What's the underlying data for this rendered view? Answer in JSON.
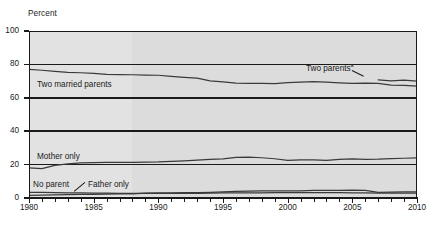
{
  "chart_data": {
    "type": "line",
    "title": "",
    "xlabel": "",
    "ylabel": "Percent",
    "xlim": [
      1980,
      2010
    ],
    "ylim": [
      0,
      100
    ],
    "yticks": [
      0,
      20,
      40,
      60,
      80,
      100
    ],
    "xticks": [
      1980,
      1985,
      1990,
      1995,
      2000,
      2005,
      2010
    ],
    "xtick_labels": [
      "1980",
      "1985",
      "1990",
      "1995",
      "2000",
      "2005",
      "2010"
    ],
    "ytick_labels": [
      "0",
      "20",
      "40",
      "60",
      "80",
      "100"
    ],
    "xtick_minor_step": 1,
    "grid": "horizontal-solid-dark",
    "legend_position": "inline-annotations",
    "background": "#dcdcdc",
    "background_band_before_year": 1988,
    "background_band_color": "#e2e2e2",
    "line_color": "#3a3a3a",
    "x": [
      1980,
      1981,
      1982,
      1983,
      1984,
      1985,
      1986,
      1987,
      1988,
      1989,
      1990,
      1991,
      1992,
      1993,
      1994,
      1995,
      1996,
      1997,
      1998,
      1999,
      2000,
      2001,
      2002,
      2003,
      2004,
      2005,
      2006,
      2007,
      2008,
      2009,
      2010
    ],
    "series": [
      {
        "name": "Two married parents",
        "label": "Two married parents",
        "label_suffix": "",
        "values": [
          77.0,
          76.5,
          75.8,
          75.2,
          75.0,
          74.6,
          74.0,
          73.9,
          73.8,
          73.6,
          73.5,
          72.9,
          72.3,
          71.8,
          70.2,
          69.5,
          68.8,
          68.6,
          68.6,
          68.5,
          69.1,
          69.4,
          69.7,
          69.4,
          69.0,
          68.6,
          68.8,
          68.6,
          67.6,
          67.4,
          67.0
        ]
      },
      {
        "name": "Two parents",
        "label": "Two parents",
        "label_suffix": "a",
        "values": [
          null,
          null,
          null,
          null,
          null,
          null,
          null,
          null,
          null,
          null,
          null,
          null,
          null,
          null,
          null,
          null,
          null,
          null,
          null,
          null,
          null,
          null,
          null,
          null,
          null,
          null,
          null,
          70.8,
          70.2,
          70.6,
          70.0
        ]
      },
      {
        "name": "Mother only",
        "label": "Mother only",
        "label_suffix": "",
        "values": [
          18.0,
          17.6,
          19.6,
          20.5,
          21.1,
          21.2,
          21.3,
          21.4,
          21.4,
          21.5,
          21.6,
          22.0,
          22.3,
          22.7,
          23.1,
          23.4,
          24.3,
          24.5,
          24.1,
          23.5,
          22.6,
          22.8,
          22.8,
          22.6,
          23.2,
          23.4,
          23.2,
          23.3,
          23.6,
          23.8,
          24.0
        ]
      },
      {
        "name": "Father only",
        "label": "Father only",
        "label_suffix": "",
        "values": [
          1.6,
          1.7,
          1.8,
          2.0,
          2.1,
          2.2,
          2.3,
          2.4,
          2.5,
          2.9,
          3.1,
          3.1,
          3.2,
          3.2,
          3.4,
          3.7,
          4.0,
          4.1,
          4.2,
          4.2,
          4.2,
          4.3,
          4.5,
          4.6,
          4.6,
          4.7,
          4.6,
          3.4,
          3.5,
          3.6,
          3.6
        ]
      },
      {
        "name": "No parent",
        "label": "No parent",
        "label_suffix": "",
        "values": [
          3.4,
          3.3,
          3.2,
          3.1,
          3.0,
          2.9,
          2.9,
          2.8,
          2.8,
          2.8,
          2.8,
          2.8,
          2.8,
          2.8,
          2.9,
          3.0,
          3.0,
          3.1,
          3.1,
          3.2,
          3.2,
          3.2,
          3.2,
          3.2,
          3.2,
          3.1,
          3.0,
          2.9,
          2.9,
          2.9,
          2.9
        ]
      }
    ],
    "annotations": [
      {
        "text": "Two married parents",
        "suffix": "",
        "x_px": 37,
        "y_px": 81
      },
      {
        "text": "Two parents",
        "suffix": "a",
        "x_px": 306,
        "y_px": 65
      },
      {
        "text": "Mother only",
        "suffix": "",
        "x_px": 37,
        "y_px": 153
      },
      {
        "text": "No parent",
        "suffix": "",
        "x_px": 33,
        "y_px": 181
      },
      {
        "text": "Father only",
        "suffix": "",
        "x_px": 88,
        "y_px": 181
      }
    ]
  }
}
